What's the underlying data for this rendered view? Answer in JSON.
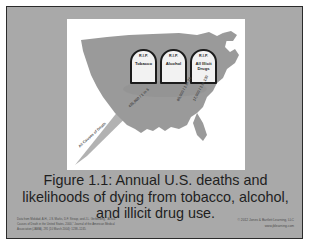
{
  "slide": {
    "background_color": "#a9a9a9",
    "border_color": "#2b2b2b",
    "panel_color": "#ffffff"
  },
  "figure": {
    "map_name": "united-states-map",
    "map_fill": "#9a9a9a",
    "handle_fill": "#b2b2b2",
    "tombstones": [
      {
        "rip": "R.I.P.",
        "label": "Tobacco"
      },
      {
        "rip": "R.I.P.",
        "label": "Alcohol"
      },
      {
        "rip": "R.I.P.",
        "label": "All Illicit Drugs"
      }
    ],
    "odds_labels": [
      {
        "id": "tobacco",
        "text": "435,000 / 1 in 5"
      },
      {
        "id": "alcohol",
        "text": "85,000 / 1 in 26"
      },
      {
        "id": "drugs",
        "text": "17,000 / 1 in 130"
      },
      {
        "id": "handle",
        "text": "All Causes of Death"
      }
    ]
  },
  "caption": {
    "line1": "Figure 1.1: Annual U.S. deaths and",
    "line2": "likelihoods of dying from tobacco, alcohol,",
    "line3": "and illicit drug use."
  },
  "footer": {
    "source_line1": "Data from Mokdad, A.H., J.S. Marks, D.F. Stroup, and J.L. Gerberding, \"Actual",
    "source_line2": "Causes of Death in the United States, 2000,\" Journal of the American Medical",
    "source_line3": "Association (JAMA), 291 (10 March 2004): 1238–1245.",
    "copyright": "© 2012 Jones & Bartlett Learning, LLC",
    "website": "www.jblearning.com"
  }
}
